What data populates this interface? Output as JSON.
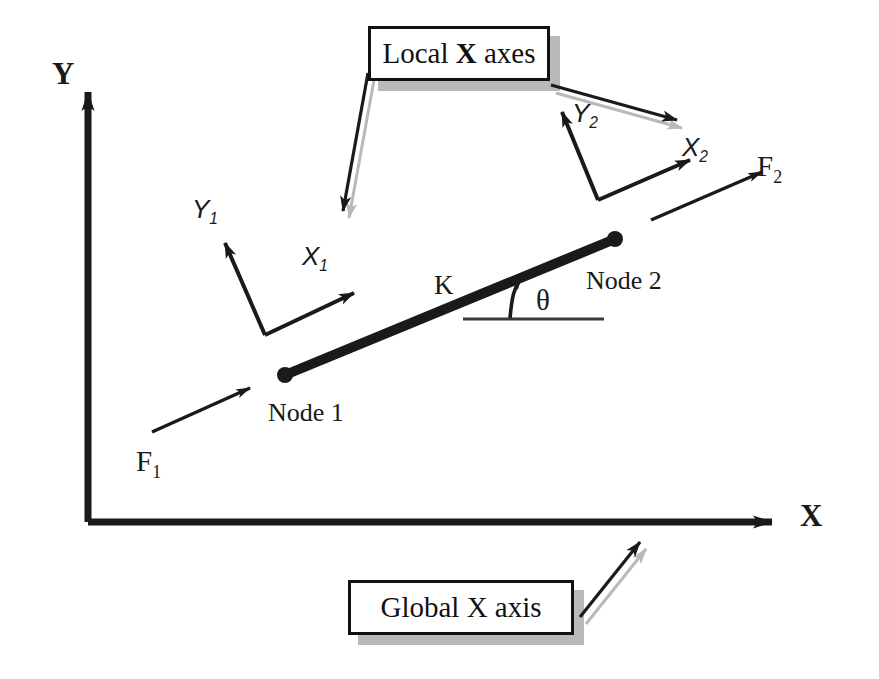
{
  "figure": {
    "background_color": "#ffffff",
    "line_color": "#1a1a1a",
    "shadow_color": "#b9b9b9"
  },
  "global_axes": {
    "y_label": "Y",
    "x_label": "X"
  },
  "element": {
    "stiffness_label": "K",
    "angle_label": "θ",
    "node1_label": "Node 1",
    "node2_label": "Node 2"
  },
  "forces": {
    "f1": {
      "base": "F",
      "sub": "1"
    },
    "f2": {
      "base": "F",
      "sub": "2"
    }
  },
  "local_frames": [
    {
      "x": {
        "base": "X",
        "sub": "1"
      },
      "y": {
        "base": "Y",
        "sub": "1"
      }
    },
    {
      "x": {
        "base": "X",
        "sub": "2"
      },
      "y": {
        "base": "Y",
        "sub": "2"
      }
    }
  ],
  "callouts": [
    {
      "prefix": "Local ",
      "emphasis": "X",
      "suffix": " axes"
    },
    {
      "prefix": "Global X axis",
      "emphasis": "",
      "suffix": ""
    }
  ]
}
